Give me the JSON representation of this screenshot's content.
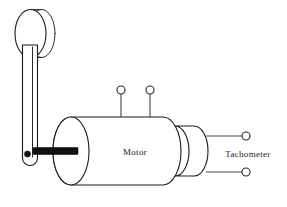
{
  "figure": {
    "background_color": "#ffffff",
    "line_color": "#1a1a1a",
    "shaft_color": "#111111",
    "width": 287,
    "height": 207
  },
  "labels": {
    "motor": "Motor",
    "tachometer": "Tachometer"
  },
  "components": {
    "flywheel": {
      "name": "flywheel-disc",
      "description": "disc at top of crank arm"
    },
    "crank_arm": {
      "name": "crank-arm",
      "description": "vertical lever linking flywheel to motor shaft"
    },
    "pivot": {
      "name": "crank-pivot-hole",
      "description": "filled pivot hole at lower end of crank arm"
    },
    "shaft": {
      "name": "motor-shaft",
      "description": "thick black output shaft"
    },
    "motor_body": {
      "name": "motor-body",
      "description": "large horizontal cylinder"
    },
    "tachometer_body": {
      "name": "tachometer-body",
      "description": "small cylinder attached to right of motor"
    }
  },
  "terminals": {
    "motor_top": [
      {
        "id": "motor-terminal-1",
        "cx": 121,
        "cy": 90,
        "r": 4.0,
        "lead_to_y": 117
      },
      {
        "id": "motor-terminal-2",
        "cx": 150,
        "cy": 90,
        "r": 4.0,
        "lead_to_y": 117
      }
    ],
    "tachometer_right": [
      {
        "id": "tachometer-terminal-1",
        "cx": 246,
        "cy": 136,
        "r": 4.0,
        "lead_from_x": 208
      },
      {
        "id": "tachometer-terminal-2",
        "cx": 246,
        "cy": 172,
        "r": 4.0,
        "lead_from_x": 208
      }
    ]
  }
}
